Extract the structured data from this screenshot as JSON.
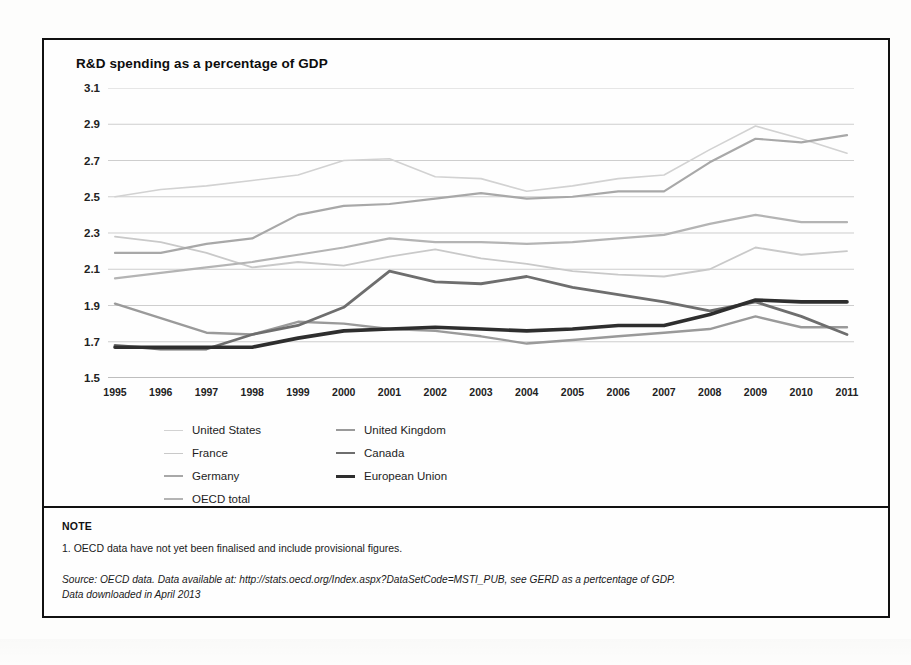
{
  "figure": {
    "title": "R&D spending as a percentage of GDP"
  },
  "note": {
    "heading": "NOTE",
    "item1": "1.  OECD data have not yet been finalised and  include provisional figures.",
    "source_line1": "Source:  OECD data. Data available at: http://stats.oecd.org/Index.aspx?DataSetCode=MSTI_PUB, see GERD as a pertcentage of GDP.",
    "source_line2": "Data downloaded in April 2013"
  },
  "legend": {
    "position": "below-axis",
    "entries": [
      {
        "label": "United States",
        "color": "#d2d2d2",
        "width": 1.6,
        "col": 0,
        "row": 0
      },
      {
        "label": "United Kingdom",
        "color": "#9a9a9a",
        "width": 2.4,
        "col": 1,
        "row": 0
      },
      {
        "label": "France",
        "color": "#c9c9c9",
        "width": 1.8,
        "col": 0,
        "row": 1
      },
      {
        "label": "Canada",
        "color": "#6e6e6e",
        "width": 2.8,
        "col": 1,
        "row": 1
      },
      {
        "label": "Germany",
        "color": "#a8a8a8",
        "width": 2.2,
        "col": 0,
        "row": 2
      },
      {
        "label": "European Union",
        "color": "#2e2e2e",
        "width": 3.6,
        "col": 1,
        "row": 2
      },
      {
        "label": "OECD total",
        "color": "#b4b4b4",
        "width": 2.2,
        "col": 0,
        "row": 3
      }
    ]
  },
  "chart_data": {
    "type": "line",
    "title": "R&D spending as a percentage of GDP",
    "xlabel": "",
    "ylabel": "",
    "grid": true,
    "ylim": [
      1.5,
      3.1
    ],
    "yticks": [
      1.5,
      1.7,
      1.9,
      2.1,
      2.3,
      2.5,
      2.7,
      2.9,
      3.1
    ],
    "categories": [
      1995,
      1996,
      1997,
      1998,
      1999,
      2000,
      2001,
      2002,
      2003,
      2004,
      2005,
      2006,
      2007,
      2008,
      2009,
      2010,
      2011
    ],
    "x": [
      "1995",
      "1996",
      "1997",
      "1998",
      "1999",
      "2000",
      "2001",
      "2002",
      "2003",
      "2004",
      "2005",
      "2006",
      "2007",
      "2008",
      "2009",
      "2010",
      "2011"
    ],
    "series": [
      {
        "name": "United States",
        "color": "#d2d2d2",
        "width": 1.6,
        "values": [
          2.5,
          2.54,
          2.56,
          2.59,
          2.62,
          2.7,
          2.71,
          2.61,
          2.6,
          2.53,
          2.56,
          2.6,
          2.62,
          2.76,
          2.89,
          2.82,
          2.74
        ]
      },
      {
        "name": "United Kingdom",
        "color": "#9a9a9a",
        "width": 2.4,
        "values": [
          1.91,
          1.83,
          1.75,
          1.74,
          1.81,
          1.8,
          1.77,
          1.76,
          1.73,
          1.69,
          1.71,
          1.73,
          1.75,
          1.77,
          1.84,
          1.78,
          1.78
        ]
      },
      {
        "name": "France",
        "color": "#c9c9c9",
        "width": 1.8,
        "values": [
          2.28,
          2.25,
          2.19,
          2.11,
          2.14,
          2.12,
          2.17,
          2.21,
          2.16,
          2.13,
          2.09,
          2.07,
          2.06,
          2.1,
          2.22,
          2.18,
          2.2
        ]
      },
      {
        "name": "Canada",
        "color": "#6e6e6e",
        "width": 2.8,
        "values": [
          1.68,
          1.66,
          1.66,
          1.74,
          1.79,
          1.89,
          2.09,
          2.03,
          2.02,
          2.06,
          2.0,
          1.96,
          1.92,
          1.87,
          1.92,
          1.84,
          1.74
        ]
      },
      {
        "name": "Germany",
        "color": "#a8a8a8",
        "width": 2.2,
        "values": [
          2.19,
          2.19,
          2.24,
          2.27,
          2.4,
          2.45,
          2.46,
          2.49,
          2.52,
          2.49,
          2.5,
          2.53,
          2.53,
          2.69,
          2.82,
          2.8,
          2.84
        ]
      },
      {
        "name": "European Union",
        "color": "#2e2e2e",
        "width": 3.6,
        "values": [
          1.67,
          1.67,
          1.67,
          1.67,
          1.72,
          1.76,
          1.77,
          1.78,
          1.77,
          1.76,
          1.77,
          1.79,
          1.79,
          1.85,
          1.93,
          1.92,
          1.92
        ]
      },
      {
        "name": "OECD total",
        "color": "#b4b4b4",
        "width": 2.2,
        "values": [
          2.05,
          2.08,
          2.11,
          2.14,
          2.18,
          2.22,
          2.27,
          2.25,
          2.25,
          2.24,
          2.25,
          2.27,
          2.29,
          2.35,
          2.4,
          2.36,
          2.36
        ]
      }
    ]
  }
}
